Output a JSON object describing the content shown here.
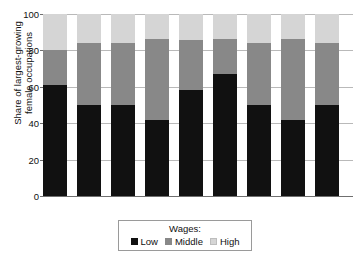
{
  "chart_data": {
    "type": "bar",
    "subtype": "stacked-bar-100",
    "title": "",
    "xlabel": "",
    "ylabel": "Share of largest-growing\nfemale occupations",
    "ylim": [
      0,
      100
    ],
    "yticks": [
      0,
      20,
      40,
      60,
      80,
      100
    ],
    "grid": true,
    "categories": [
      "1994",
      "1996",
      "1998",
      "2000",
      "2002",
      "2004",
      "2006",
      "2008",
      "2010"
    ],
    "series": [
      {
        "name": "Low",
        "color": "#111111",
        "values": [
          61,
          50,
          50,
          42,
          58,
          67,
          50,
          42,
          50
        ]
      },
      {
        "name": "Middle",
        "color": "#888888",
        "values": [
          19,
          34,
          34,
          44,
          28,
          19,
          34,
          44,
          34
        ]
      },
      {
        "name": "High",
        "color": "#d5d5d5",
        "values": [
          20,
          16,
          16,
          14,
          14,
          14,
          16,
          14,
          16
        ]
      }
    ],
    "cumulative_tops": {
      "low_plus_middle": [
        80,
        84,
        84,
        86,
        86,
        86,
        84,
        86,
        84
      ],
      "total": [
        100,
        100,
        100,
        100,
        100,
        100,
        100,
        100,
        100
      ]
    },
    "legend": {
      "position": "bottom",
      "title": "Wages:",
      "entries": [
        {
          "label": "Low",
          "color": "#111111"
        },
        {
          "label": "Middle",
          "color": "#888888"
        },
        {
          "label": "High",
          "color": "#d5d5d5"
        }
      ]
    }
  }
}
